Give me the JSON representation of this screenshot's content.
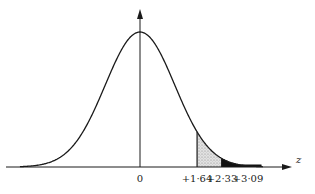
{
  "chart_data": {
    "type": "area",
    "title": "",
    "xlabel": "z",
    "ylabel": "",
    "tick_labels": [
      "0",
      "+1·64",
      "+2·33",
      "+3·09"
    ],
    "ticks": [
      0,
      1.64,
      2.33,
      3.09
    ],
    "xlim": [
      -3.5,
      4.4
    ],
    "curve": "standard normal density",
    "shaded_regions": [
      {
        "from": 1.64,
        "to": 2.33,
        "style": "stippled grey",
        "color": "#c8c8c8"
      },
      {
        "from": 2.33,
        "to": 3.5,
        "style": "solid black",
        "color": "#111111"
      }
    ],
    "grid": false,
    "legend": null
  },
  "axis": {
    "x_label": "z",
    "origin_label": "0",
    "tick_1": "+1·64",
    "tick_2": "+2·33",
    "tick_3": "+3·09"
  },
  "colors": {
    "ink": "#1a1a1a",
    "stipple": "#c8c8c8",
    "tail": "#111111"
  }
}
